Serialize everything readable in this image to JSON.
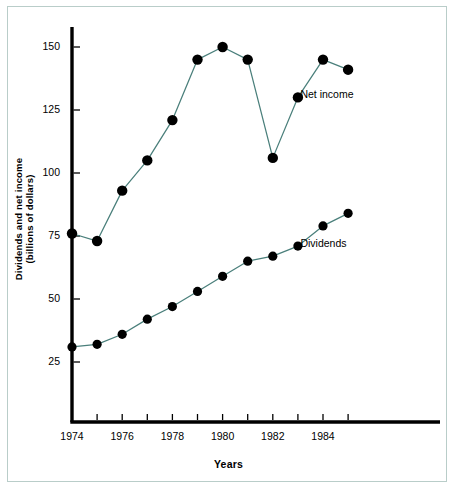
{
  "chart_data": {
    "type": "line",
    "title": "",
    "xlabel": "Years",
    "ylabel": "Dividends and net income\n(billions of dollars)",
    "x": [
      1974,
      1975,
      1976,
      1977,
      1978,
      1979,
      1980,
      1981,
      1982,
      1983,
      1984,
      1985
    ],
    "xlim": [
      1974,
      1985
    ],
    "ylim": [
      0,
      158
    ],
    "xticks": [
      1974,
      1975,
      1976,
      1977,
      1978,
      1979,
      1980,
      1981,
      1982,
      1983,
      1984,
      1985
    ],
    "xtick_labels": [
      "1974",
      "",
      "1976",
      "",
      "1978",
      "",
      "1980",
      "",
      "1982",
      "",
      "1984",
      ""
    ],
    "yticks": [
      25,
      50,
      75,
      100,
      125,
      150
    ],
    "ytick_labels": [
      "25",
      "50",
      "75",
      "100",
      "125",
      "150"
    ],
    "grid": false,
    "legend_position": "inline-annotations",
    "series": [
      {
        "name": "Net income",
        "values": [
          76,
          73,
          93,
          105,
          121,
          145,
          150,
          145,
          106,
          130,
          145,
          141
        ],
        "line_color": "#4a7f7b",
        "marker_color": "#000000",
        "marker_size": 5.2,
        "annotation": {
          "text": "Net income",
          "x": 1983.1,
          "y": 131
        }
      },
      {
        "name": "Dividends",
        "values": [
          31,
          32,
          36,
          42,
          47,
          53,
          59,
          65,
          67,
          71,
          79,
          84
        ],
        "line_color": "#4a7f7b",
        "marker_color": "#000000",
        "marker_size": 4.6,
        "annotation": {
          "text": "Dividends",
          "x": 1983.1,
          "y": 72
        }
      }
    ],
    "axis_color": "#000000",
    "frame_color": "#b9cdc9",
    "background": "#ffffff"
  }
}
